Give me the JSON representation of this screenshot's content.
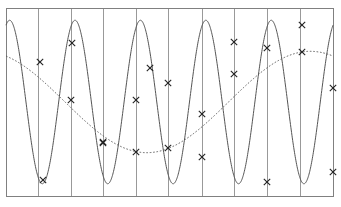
{
  "chart_data": {
    "type": "line",
    "title": "",
    "subtitle": "",
    "xlabel": "",
    "ylabel": "",
    "xlim": [
      0,
      10
    ],
    "ylim": [
      -1.15,
      1.15
    ],
    "grid": "vertical-only",
    "legend": "none",
    "frame": {
      "visible": true,
      "color": "#808080",
      "x0": 6,
      "y0": 8,
      "x1": 333,
      "y1": 196
    },
    "gridlines": {
      "orientation": "vertical",
      "color": "#999999",
      "x_values": [
        1,
        2,
        3,
        4,
        5,
        6,
        7,
        8,
        9
      ],
      "pixel_x": [
        38,
        71,
        103,
        136,
        168,
        202,
        234,
        267,
        300
      ]
    },
    "series": [
      {
        "name": "high-frequency-sine",
        "style": "solid",
        "color": "#555555",
        "marker": "x",
        "frequency_cycles": 5.0,
        "amplitude": 1.0,
        "phase_deg": 70,
        "x": [
          0,
          1,
          2,
          3,
          4,
          5,
          6,
          7,
          8,
          9,
          10
        ],
        "y": [
          0.94,
          -1.0,
          0.87,
          -0.98,
          0.22,
          0.38,
          -0.74,
          0.63,
          -1.0,
          0.98,
          -0.75
        ],
        "marker_pixels": [
          {
            "x": 43,
            "y": 180
          },
          {
            "x": 72,
            "y": 43
          },
          {
            "x": 103,
            "y": 143
          },
          {
            "x": 136,
            "y": 100
          },
          {
            "x": 150,
            "y": 68
          },
          {
            "x": 168,
            "y": 83
          },
          {
            "x": 202,
            "y": 157
          },
          {
            "x": 234,
            "y": 42
          },
          {
            "x": 267,
            "y": 182
          },
          {
            "x": 302,
            "y": 25
          },
          {
            "x": 333,
            "y": 172
          }
        ]
      },
      {
        "name": "low-frequency-sine",
        "style": "dotted",
        "color": "#555555",
        "marker": "x",
        "frequency_cycles": 1.0,
        "amplitude": 0.62,
        "phase_deg": 115,
        "x": [
          0,
          1,
          2,
          3,
          4,
          5,
          6,
          7,
          8,
          9,
          10
        ],
        "y": [
          0.56,
          0.4,
          0.08,
          -0.25,
          -0.52,
          -0.6,
          -0.45,
          -0.1,
          0.3,
          0.55,
          0.42
        ],
        "marker_pixels": [
          {
            "x": 40,
            "y": 62
          },
          {
            "x": 71,
            "y": 100
          },
          {
            "x": 103,
            "y": 142
          },
          {
            "x": 136,
            "y": 152
          },
          {
            "x": 168,
            "y": 148
          },
          {
            "x": 202,
            "y": 114
          },
          {
            "x": 234,
            "y": 74
          },
          {
            "x": 267,
            "y": 48
          },
          {
            "x": 302,
            "y": 52
          },
          {
            "x": 333,
            "y": 88
          }
        ]
      }
    ]
  }
}
